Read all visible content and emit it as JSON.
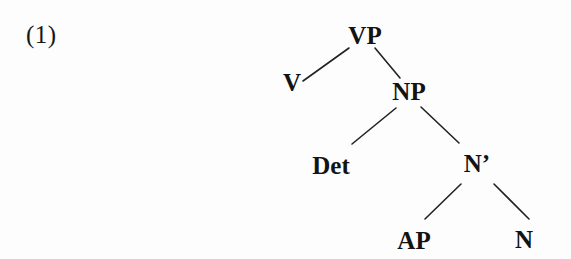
{
  "page": {
    "background_color": "#fdfdfd",
    "ink_color": "#131313"
  },
  "example": {
    "label": "(1)"
  },
  "tree": {
    "title": "syntactic phrase structure tree",
    "nodes": [
      {
        "id": "VP",
        "label": "VP",
        "x": 365,
        "y": 35
      },
      {
        "id": "V",
        "label": "V",
        "x": 292,
        "y": 82
      },
      {
        "id": "NP",
        "label": "NP",
        "x": 409,
        "y": 91
      },
      {
        "id": "Det",
        "label": "Det",
        "x": 331,
        "y": 165
      },
      {
        "id": "Nbar",
        "label": "N’",
        "x": 477,
        "y": 163
      },
      {
        "id": "AP",
        "label": "AP",
        "x": 414,
        "y": 240
      },
      {
        "id": "N",
        "label": "N",
        "x": 524,
        "y": 239
      }
    ],
    "edges": [
      {
        "from": "V",
        "to": "VP",
        "x1": 303,
        "y1": 81,
        "x2": 349,
        "y2": 48
      },
      {
        "from": "VP",
        "to": "NP",
        "x1": 375,
        "y1": 48,
        "x2": 400,
        "y2": 78
      },
      {
        "from": "NP",
        "to": "Det",
        "x1": 352,
        "y1": 144,
        "x2": 396,
        "y2": 108
      },
      {
        "from": "NP",
        "to": "Nbar",
        "x1": 421,
        "y1": 107,
        "x2": 459,
        "y2": 143
      },
      {
        "from": "Nbar",
        "to": "AP",
        "x1": 425,
        "y1": 219,
        "x2": 461,
        "y2": 184
      },
      {
        "from": "Nbar",
        "to": "N",
        "x1": 494,
        "y1": 184,
        "x2": 529,
        "y2": 219
      }
    ],
    "edge_color": "#222222",
    "edge_width": 1.6
  }
}
